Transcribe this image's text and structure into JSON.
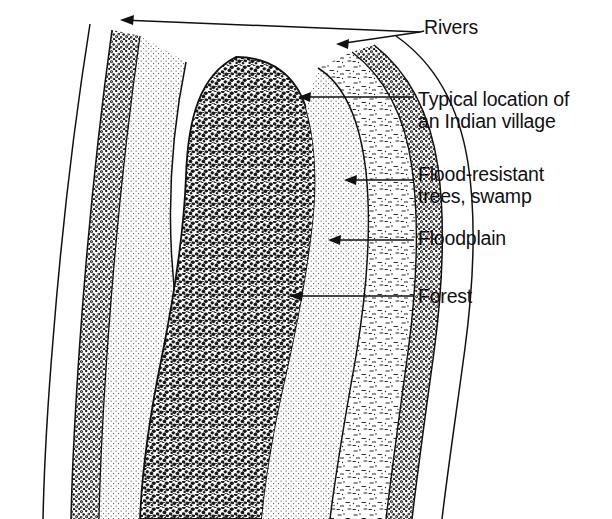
{
  "figure": {
    "type": "cross-section-diagram",
    "background_color": "#ffffff",
    "ink_color": "#111111"
  },
  "labels": [
    {
      "id": "rivers",
      "text": "Rivers",
      "lines": [
        "Rivers"
      ],
      "leader": "two-branch-arrow",
      "points_to": [
        "left river channel",
        "right river channel"
      ]
    },
    {
      "id": "village",
      "text": "Typical location of an Indian village",
      "lines": [
        "Typical location of",
        "an Indian village"
      ],
      "leader": "arrow",
      "points_to": "levee crest beside right river"
    },
    {
      "id": "swamp",
      "text": "Flood-resistant trees, swamp",
      "lines": [
        "Flood-resistant",
        "trees, swamp"
      ],
      "leader": "arrow",
      "points_to": "swamp band"
    },
    {
      "id": "floodplain",
      "text": "Floodplain",
      "lines": [
        "Floodplain"
      ],
      "leader": "arrow",
      "points_to": "stippled floodplain zone"
    },
    {
      "id": "forest",
      "text": "Forest",
      "lines": [
        "Forest"
      ],
      "leader": "arrow",
      "points_to": "dense forest canopy texture"
    }
  ],
  "zones": [
    {
      "name": "river-channel-left",
      "fill": "white",
      "description": "narrow open water band at far left"
    },
    {
      "name": "gravel-bank-left",
      "fill": "stippled-coarse",
      "description": "coarse gravelly levee bank"
    },
    {
      "name": "floodplain-left",
      "fill": "fine-stipple",
      "description": "light stippled floodplain"
    },
    {
      "name": "forest",
      "fill": "dense-scribble",
      "description": "large central lobe of dense canopy texture"
    },
    {
      "name": "floodplain-right",
      "fill": "fine-stipple",
      "description": "light stippled floodplain"
    },
    {
      "name": "swamp-right",
      "fill": "sparse-dash",
      "description": "sparse dashed swamp with flood-resistant trees"
    },
    {
      "name": "gravel-bank-right",
      "fill": "stippled-coarse",
      "description": "coarse gravelly levee bank"
    },
    {
      "name": "river-channel-right",
      "fill": "white",
      "description": "narrow open water band at right"
    }
  ]
}
